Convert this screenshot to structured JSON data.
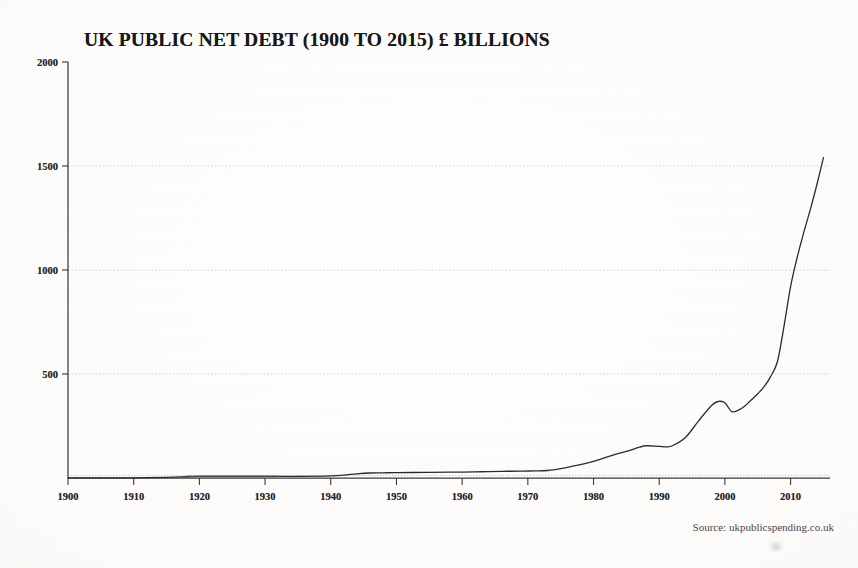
{
  "chart_data": {
    "type": "line",
    "title": "UK PUBLIC NET DEBT (1900 TO 2015) £ BILLIONS",
    "xlabel": "",
    "ylabel": "",
    "unit": "£ Billions",
    "source": "Source: ukpublicspending.co.uk",
    "xlim": [
      1900,
      2016
    ],
    "ylim": [
      0,
      2000
    ],
    "grid": "horizontal-dotted",
    "legend": "none",
    "y_ticks": [
      0,
      500,
      1000,
      1500,
      2000
    ],
    "y_tick_labels": [
      "",
      "500",
      "1000",
      "1500",
      "2000"
    ],
    "x_ticks": [
      1900,
      1910,
      1920,
      1930,
      1940,
      1950,
      1960,
      1970,
      1980,
      1990,
      2000,
      2010
    ],
    "x_tick_labels": [
      "1900",
      "1910",
      "1920",
      "1930",
      "1940",
      "1950",
      "1960",
      "1970",
      "1980",
      "1990",
      "2000",
      "2010"
    ],
    "line_color": "#2b2930",
    "axis_color": "#3a383f",
    "gridline_color": "#cfcdd2",
    "background_color": "#fbfaf8",
    "series": [
      {
        "name": "UK Public Net Debt",
        "x": [
          1900,
          1905,
          1910,
          1915,
          1918,
          1920,
          1925,
          1930,
          1935,
          1940,
          1942,
          1944,
          1946,
          1948,
          1950,
          1955,
          1958,
          1960,
          1963,
          1966,
          1969,
          1971,
          1973,
          1975,
          1977,
          1979,
          1981,
          1983,
          1985,
          1987,
          1988,
          1990,
          1991,
          1992,
          1994,
          1996,
          1998,
          1999,
          2000,
          2001,
          2002,
          2003,
          2004,
          2005,
          2006,
          2007,
          2008,
          2009,
          2010,
          2011,
          2012,
          2013,
          2014,
          2015
        ],
        "y": [
          1,
          1,
          1,
          3,
          6,
          8,
          8,
          8,
          8,
          10,
          14,
          20,
          24,
          25,
          26,
          27,
          28,
          28,
          30,
          32,
          33,
          34,
          36,
          45,
          58,
          72,
          90,
          110,
          128,
          148,
          155,
          152,
          150,
          155,
          195,
          275,
          350,
          368,
          362,
          320,
          325,
          345,
          375,
          405,
          440,
          490,
          560,
          730,
          920,
          1060,
          1180,
          1290,
          1410,
          1540
        ]
      }
    ]
  },
  "annotations": {
    "title_note": "",
    "smudge": ""
  }
}
